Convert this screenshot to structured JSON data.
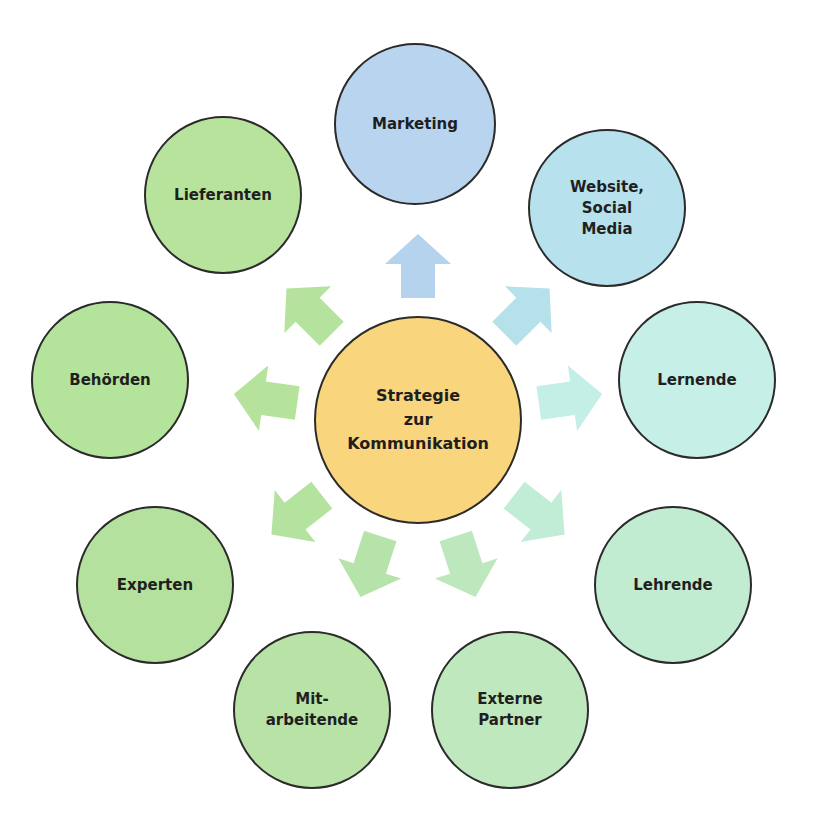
{
  "diagram": {
    "title": "Strategie zur Kommunikation",
    "center": {
      "label": "Strategie\nzur\nKommunikation",
      "x": 418,
      "y": 420,
      "r": 103,
      "color": "#f9d57d"
    },
    "nodes": [
      {
        "id": "marketing",
        "label": "Marketing",
        "x": 415,
        "y": 124,
        "r": 80,
        "color": "#b9d4ee",
        "arrow_color": "#b6d3ee",
        "angle": -90
      },
      {
        "id": "website",
        "label": "Website,\nSocial\nMedia",
        "x": 607,
        "y": 208,
        "r": 78,
        "color": "#b7e1ec",
        "arrow_color": "#b5e1ea",
        "angle": -45
      },
      {
        "id": "lernende",
        "label": "Lernende",
        "x": 697,
        "y": 380,
        "r": 78,
        "color": "#c6efe7",
        "arrow_color": "#c3efe6",
        "angle": -8
      },
      {
        "id": "lehrende",
        "label": "Lehrende",
        "x": 673,
        "y": 585,
        "r": 78,
        "color": "#c2ecd2",
        "arrow_color": "#c1edd6",
        "angle": 38
      },
      {
        "id": "externe-partner",
        "label": "Externe\nPartner",
        "x": 510,
        "y": 710,
        "r": 78,
        "color": "#bfe8be",
        "arrow_color": "#bde8bd",
        "angle": 72
      },
      {
        "id": "mitarbeitende",
        "label": "Mit-\narbeitende",
        "x": 312,
        "y": 710,
        "r": 78,
        "color": "#b8e2a6",
        "arrow_color": "#b6e3a9",
        "angle": 108
      },
      {
        "id": "experten",
        "label": "Experten",
        "x": 155,
        "y": 585,
        "r": 78,
        "color": "#b4e19d",
        "arrow_color": "#b4e39f",
        "angle": 142
      },
      {
        "id": "behoerden",
        "label": "Behörden",
        "x": 110,
        "y": 380,
        "r": 78,
        "color": "#b4e39c",
        "arrow_color": "#b5e39c",
        "angle": 188
      },
      {
        "id": "lieferanten",
        "label": "Lieferanten",
        "x": 223,
        "y": 195,
        "r": 78,
        "color": "#b8e39d",
        "arrow_color": "#b5e39e",
        "angle": 225
      }
    ],
    "arrow_radius": 152
  }
}
